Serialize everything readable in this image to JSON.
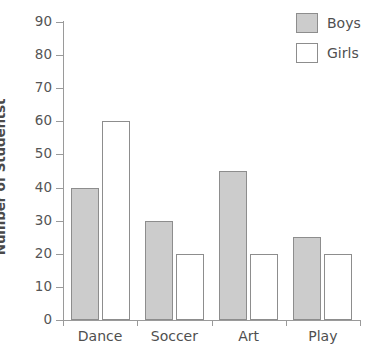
{
  "chart_data": {
    "type": "bar",
    "title": "",
    "xlabel": "",
    "ylabel": "Number of Studentst",
    "categories": [
      "Dance",
      "Soccer",
      "Art",
      "Play"
    ],
    "series": [
      {
        "name": "Boys",
        "color": "#cccccc",
        "values": [
          40,
          30,
          45,
          25
        ]
      },
      {
        "name": "Girls",
        "color": "#ffffff",
        "values": [
          60,
          20,
          20,
          20
        ]
      }
    ],
    "ylim": [
      0,
      90
    ],
    "ytick_step": 10,
    "ytick_labels": [
      "0",
      "10",
      "20",
      "30",
      "40",
      "50",
      "60",
      "70",
      "80",
      "90"
    ],
    "grid": false,
    "legend_position": "top-right",
    "legend_entries": [
      "Boys",
      "Girls"
    ],
    "axis_color": "#9a9a9a",
    "bar_edge_color": "#8d8d8d",
    "text_color": "#4f4f4f"
  }
}
